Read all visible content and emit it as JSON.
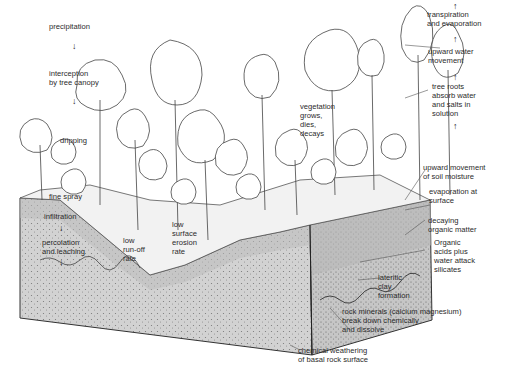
{
  "diagram": {
    "colors": {
      "soil_block": "#cfcfcf",
      "soil_top_band": "#bdbdbd",
      "lines": "#333333",
      "background": "#ffffff"
    },
    "labels_left": {
      "precipitation": "precipitation",
      "interception": "interception\nby tree canopy",
      "dripping": "dripping",
      "fine_spray": "fine spray",
      "infiltration": "infiltration",
      "percolation": "percolation\nand leaching",
      "low_runoff": "low\nrun-off\nrate",
      "low_erosion": "low\nsurface\nerosion\nrate",
      "vegetation": "vegetation\ngrows,\ndies,\ndecays"
    },
    "labels_right": {
      "transpiration": "transpiration\nand evaporation",
      "upward_water": "upward water\nmovement",
      "tree_roots": "tree roots\nabsorb water\nand salts in\nsolution",
      "soil_moisture": "upward movement\nof soil moisture",
      "evaporation_surface": "evaporation at\nsurface",
      "decaying": "decaying\norganic matter",
      "organic_acids": "Organic\nacids plus\nwater attack\nsilicates",
      "lateritic": "lateritic\nclay\nformation",
      "rock_minerals": "rock minerals (calcium magnesium)\nbreak down chemically\nand dissolve",
      "chemical_weathering": "chemical weathering\nof basal rock surface"
    },
    "arrows": {
      "down": "↓",
      "up": "↑"
    }
  }
}
